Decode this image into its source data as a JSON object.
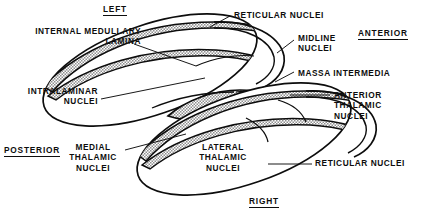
{
  "figure": {
    "background_color": "#ffffff",
    "ink_color": "#0d0d0d",
    "hatch_fill_color": "#9a9a9a"
  },
  "orientation_labels": [
    {
      "id": "left",
      "text": "LEFT",
      "x": 103,
      "y": 4
    },
    {
      "id": "anterior",
      "text": "ANTERIOR",
      "x": 358,
      "y": 28
    },
    {
      "id": "posterior",
      "text": "POSTERIOR",
      "x": 4,
      "y": 145
    },
    {
      "id": "right",
      "text": "RIGHT",
      "x": 249,
      "y": 196
    }
  ],
  "structure_labels": [
    {
      "id": "internal-medullary-lamina",
      "lines": [
        "INTERNAL MEDULLARY",
        "LAMINA"
      ],
      "align": "right",
      "x": 56,
      "y": 26
    },
    {
      "id": "reticular-nuclei-top",
      "lines": [
        "RETICULAR NUCLEI"
      ],
      "align": "left",
      "x": 231,
      "y": 10
    },
    {
      "id": "midline-nuclei",
      "lines": [
        "MIDLINE",
        "NUCLEI"
      ],
      "align": "left",
      "x": 296,
      "y": 33
    },
    {
      "id": "massa-intermedia",
      "lines": [
        "MASSA INTERMEDIA"
      ],
      "align": "left",
      "x": 295,
      "y": 68
    },
    {
      "id": "intralaminar-nuclei",
      "lines": [
        "INTRALAMINAR",
        "NUCLEI"
      ],
      "align": "right",
      "x": 28,
      "y": 86
    },
    {
      "id": "anterior-thalamic-nuclei",
      "lines": [
        "ANTERIOR",
        "THALAMIC",
        "NUCLEI"
      ],
      "align": "left",
      "x": 331,
      "y": 90
    },
    {
      "id": "medial-thalamic-nuclei",
      "lines": [
        "MEDIAL",
        "THALAMIC",
        "NUCLEI"
      ],
      "align": "center",
      "x": 79,
      "y": 142
    },
    {
      "id": "lateral-thalamic-nuclei",
      "lines": [
        "LATERAL",
        "THALAMIC",
        "NUCLEI"
      ],
      "align": "center",
      "x": 196,
      "y": 142
    },
    {
      "id": "reticular-nuclei-bottom",
      "lines": [
        "RETICULAR NUCLEI"
      ],
      "align": "left",
      "x": 313,
      "y": 158
    }
  ],
  "leader_lines": [
    {
      "id": "leader-internal-medullary-lamina",
      "from": [
        134,
        44
      ],
      "to": [
        196,
        66
      ]
    },
    {
      "id": "leader-intralaminar-nuclei",
      "from": [
        101,
        99
      ],
      "to": [
        205,
        78
      ]
    },
    {
      "id": "leader-reticular-nuclei-top",
      "from": [
        230,
        16
      ],
      "to": [
        213,
        25
      ]
    },
    {
      "id": "leader-midline-nuclei",
      "from": [
        294,
        40
      ],
      "to": [
        277,
        52
      ]
    },
    {
      "id": "leader-massa-intermedia",
      "from": [
        294,
        72
      ],
      "to": [
        276,
        81
      ]
    },
    {
      "id": "leader-anterior-thalamic-nuclei",
      "from": [
        330,
        95
      ],
      "to": [
        290,
        95
      ]
    },
    {
      "id": "leader-medial-thalamic-nuclei",
      "from": [
        125,
        150
      ],
      "to": [
        185,
        135
      ]
    },
    {
      "id": "leader-reticular-nuclei-bottom",
      "from": [
        312,
        164
      ],
      "to": [
        271,
        164
      ]
    }
  ]
}
